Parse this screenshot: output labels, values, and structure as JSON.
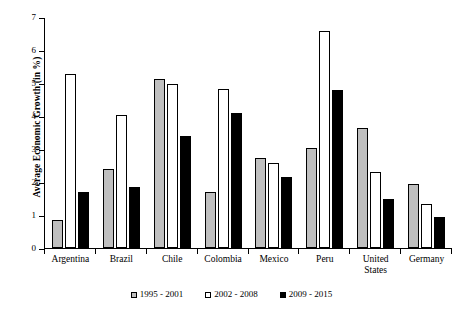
{
  "chart_data": {
    "type": "bar",
    "title": "",
    "subtitle": "",
    "xlabel": "",
    "ylabel": "Average Economic Growth (in %)",
    "ylim": [
      0,
      7
    ],
    "ytick_labels": [
      "0",
      "1",
      "2",
      "3",
      "4",
      "5",
      "6",
      "7"
    ],
    "ytick_values": [
      0,
      1,
      2,
      3,
      4,
      5,
      6,
      7
    ],
    "grid": false,
    "legend_position": "bottom-center",
    "categories": [
      "Argentina",
      "Brazil",
      "Chile",
      "Colombia",
      "Mexico",
      "Peru",
      "United States",
      "Germany"
    ],
    "series": [
      {
        "name": "1995 - 2001",
        "color": "#bfbfbf",
        "values": [
          0.85,
          2.4,
          5.15,
          1.7,
          2.75,
          3.05,
          3.65,
          1.95
        ]
      },
      {
        "name": "2002 - 2008",
        "color": "#ffffff",
        "values": [
          5.3,
          4.05,
          5.0,
          4.85,
          2.6,
          6.6,
          2.3,
          1.35
        ]
      },
      {
        "name": "2009 - 2015",
        "color": "#000000",
        "values": [
          1.7,
          1.85,
          3.4,
          4.1,
          2.15,
          4.8,
          1.5,
          0.95
        ]
      }
    ]
  }
}
